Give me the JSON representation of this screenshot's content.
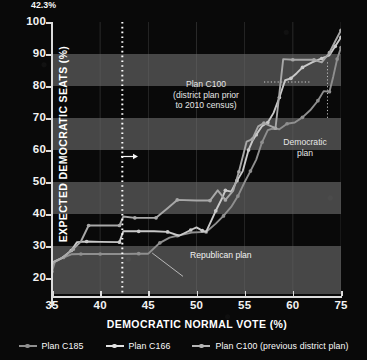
{
  "chart_data": {
    "type": "line",
    "title": "",
    "xlabel": "DEMOCRATIC NORMAL VOTE (%)",
    "ylabel": "EXPECTED DEMOCRATIC SEATS (%)",
    "xlim": [
      35,
      65
    ],
    "ylim": [
      15,
      100
    ],
    "xticks": [
      35,
      40,
      45,
      50,
      55,
      60,
      75
    ],
    "yticks": [
      20,
      30,
      40,
      50,
      60,
      70,
      80,
      90,
      100
    ],
    "grid": "horizontal-bands",
    "legend_position": "bottom",
    "band_color": "#474747",
    "background": "#090909",
    "series": [
      {
        "name": "Plan C185",
        "role": "Republican plan",
        "color": "#8f8f8f",
        "points": [
          [
            35.0,
            22.0
          ],
          [
            35.3,
            25.0
          ],
          [
            36.2,
            26.4
          ],
          [
            37.0,
            27.4
          ],
          [
            38.0,
            27.5
          ],
          [
            39.0,
            27.5
          ],
          [
            40.0,
            27.5
          ],
          [
            42.0,
            27.5
          ],
          [
            44.0,
            27.6
          ],
          [
            45.0,
            27.6
          ],
          [
            46.2,
            31.0
          ],
          [
            47.2,
            32.6
          ],
          [
            48.0,
            33.2
          ],
          [
            49.5,
            34.2
          ],
          [
            51.0,
            34.4
          ],
          [
            52.0,
            37.0
          ],
          [
            52.8,
            39.4
          ],
          [
            53.6,
            42.2
          ],
          [
            54.3,
            45.6
          ],
          [
            55.0,
            50.0
          ],
          [
            55.6,
            53.4
          ],
          [
            56.2,
            57.0
          ],
          [
            56.8,
            62.4
          ],
          [
            57.4,
            66.2
          ],
          [
            58.0,
            66.8
          ],
          [
            58.6,
            66.5
          ],
          [
            59.4,
            68.2
          ],
          [
            60.2,
            68.6
          ],
          [
            61.0,
            70.2
          ],
          [
            61.8,
            72.4
          ],
          [
            62.6,
            75.4
          ],
          [
            63.2,
            78.4
          ],
          [
            63.8,
            78.2
          ],
          [
            64.2,
            83.0
          ],
          [
            64.6,
            88.4
          ],
          [
            65.0,
            92.0
          ]
        ]
      },
      {
        "name": "Plan C166",
        "role": "Democratic plan",
        "color": "#c9c9c9",
        "points": [
          [
            35.0,
            24.8
          ],
          [
            36.0,
            26.2
          ],
          [
            37.0,
            28.6
          ],
          [
            37.6,
            31.2
          ],
          [
            38.6,
            31.4
          ],
          [
            40.0,
            31.3
          ],
          [
            42.0,
            31.2
          ],
          [
            42.4,
            34.6
          ],
          [
            44.0,
            34.6
          ],
          [
            45.6,
            34.6
          ],
          [
            47.0,
            34.4
          ],
          [
            48.2,
            33.2
          ],
          [
            49.4,
            35.0
          ],
          [
            50.0,
            35.8
          ],
          [
            50.6,
            34.8
          ],
          [
            51.0,
            34.4
          ],
          [
            52.0,
            41.0
          ],
          [
            52.6,
            44.6
          ],
          [
            53.0,
            47.4
          ],
          [
            53.6,
            47.0
          ],
          [
            54.2,
            50.4
          ],
          [
            54.8,
            53.4
          ],
          [
            55.4,
            60.0
          ],
          [
            55.8,
            62.8
          ],
          [
            56.2,
            64.8
          ],
          [
            56.8,
            67.4
          ],
          [
            57.4,
            68.6
          ],
          [
            58.0,
            71.6
          ],
          [
            58.6,
            76.4
          ],
          [
            59.2,
            81.8
          ],
          [
            59.8,
            82.4
          ],
          [
            60.4,
            84.0
          ],
          [
            61.0,
            85.8
          ],
          [
            62.0,
            87.4
          ],
          [
            63.0,
            88.6
          ],
          [
            63.8,
            89.6
          ],
          [
            64.4,
            92.4
          ],
          [
            65.0,
            95.2
          ]
        ]
      },
      {
        "name": "Plan C100 (previous district plan)",
        "role": "district plan prior to 2010 census",
        "color": "#a8a8a8",
        "points": [
          [
            35.0,
            24.6
          ],
          [
            36.2,
            26.6
          ],
          [
            37.2,
            29.0
          ],
          [
            38.0,
            31.4
          ],
          [
            38.8,
            36.4
          ],
          [
            40.0,
            36.4
          ],
          [
            42.0,
            36.4
          ],
          [
            42.4,
            39.2
          ],
          [
            43.6,
            38.8
          ],
          [
            44.6,
            38.8
          ],
          [
            45.8,
            38.8
          ],
          [
            47.0,
            41.8
          ],
          [
            48.0,
            44.4
          ],
          [
            50.0,
            44.2
          ],
          [
            51.4,
            44.2
          ],
          [
            52.2,
            47.4
          ],
          [
            53.0,
            44.4
          ],
          [
            53.8,
            47.2
          ],
          [
            54.4,
            53.2
          ],
          [
            55.2,
            62.6
          ],
          [
            55.8,
            63.4
          ],
          [
            56.4,
            67.4
          ],
          [
            57.0,
            68.4
          ],
          [
            57.6,
            67.6
          ],
          [
            58.2,
            66.8
          ],
          [
            59.0,
            88.4
          ],
          [
            60.0,
            88.2
          ],
          [
            61.2,
            88.2
          ],
          [
            62.2,
            88.2
          ],
          [
            63.0,
            87.4
          ],
          [
            63.8,
            90.4
          ],
          [
            64.4,
            94.0
          ],
          [
            65.0,
            97.4
          ]
        ]
      }
    ],
    "reference_line": {
      "x": 42.3,
      "label": "42.3%",
      "style": "dotted",
      "color": "#ffffff"
    },
    "annotations": [
      {
        "name": "plan-c100",
        "lines": [
          "Plan C100",
          "(district plan prior",
          "to 2010 census)"
        ]
      },
      {
        "name": "democratic-plan",
        "lines": [
          "Democratic",
          "plan"
        ]
      },
      {
        "name": "republican-plan",
        "lines": [
          "Republican plan"
        ]
      }
    ]
  },
  "axes": {
    "y_title": "EXPECTED DEMOCRATIC SEATS (%)",
    "x_title": "DEMOCRATIC NORMAL VOTE (%)",
    "y_ticks": [
      "20",
      "30",
      "40",
      "50",
      "60",
      "70",
      "80",
      "90",
      "100"
    ],
    "x_ticks": [
      "35",
      "40",
      "45",
      "50",
      "55",
      "60",
      "75"
    ]
  },
  "annotations": {
    "c100_l1": "Plan C100",
    "c100_l2": "(district plan prior",
    "c100_l3": "to 2010 census)",
    "dem_l1": "Democratic",
    "dem_l2": "plan",
    "rep": "Republican plan",
    "refline": "42.3%"
  },
  "legend": {
    "items": [
      {
        "label": "Plan C185",
        "color": "#8f8f8f"
      },
      {
        "label": "Plan C166",
        "color": "#e2e2e2"
      },
      {
        "label": "Plan C100 (previous district plan)",
        "color": "#b5b5b5"
      }
    ]
  }
}
